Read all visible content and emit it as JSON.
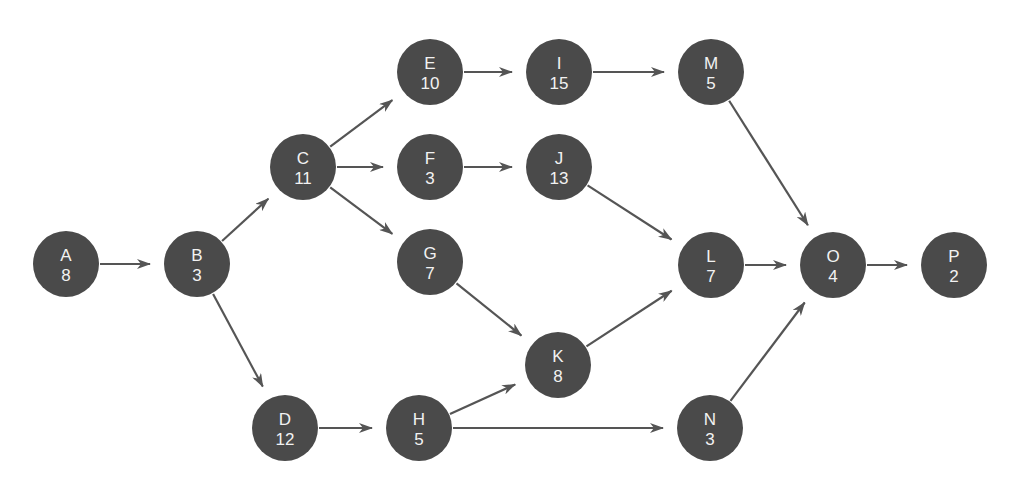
{
  "diagram": {
    "type": "activity-on-node network",
    "colors": {
      "node_fill": "#4a4a4a",
      "node_text": "#f2f2f2",
      "edge": "#555555",
      "background": "#ffffff"
    },
    "node_radius": 33,
    "nodes": [
      {
        "id": "A",
        "duration": "8",
        "x": 66,
        "y": 264
      },
      {
        "id": "B",
        "duration": "3",
        "x": 197,
        "y": 264
      },
      {
        "id": "C",
        "duration": "11",
        "x": 303,
        "y": 167
      },
      {
        "id": "D",
        "duration": "12",
        "x": 285,
        "y": 428
      },
      {
        "id": "E",
        "duration": "10",
        "x": 430,
        "y": 72
      },
      {
        "id": "F",
        "duration": "3",
        "x": 430,
        "y": 167
      },
      {
        "id": "G",
        "duration": "7",
        "x": 430,
        "y": 262
      },
      {
        "id": "H",
        "duration": "5",
        "x": 419,
        "y": 428
      },
      {
        "id": "I",
        "duration": "15",
        "x": 559,
        "y": 72
      },
      {
        "id": "J",
        "duration": "13",
        "x": 559,
        "y": 167
      },
      {
        "id": "K",
        "duration": "8",
        "x": 558,
        "y": 365
      },
      {
        "id": "L",
        "duration": "7",
        "x": 711,
        "y": 265
      },
      {
        "id": "M",
        "duration": "5",
        "x": 711,
        "y": 72
      },
      {
        "id": "N",
        "duration": "3",
        "x": 710,
        "y": 428
      },
      {
        "id": "O",
        "duration": "4",
        "x": 833,
        "y": 265
      },
      {
        "id": "P",
        "duration": "2",
        "x": 954,
        "y": 265
      }
    ],
    "edges": [
      [
        "A",
        "B"
      ],
      [
        "B",
        "C"
      ],
      [
        "B",
        "D"
      ],
      [
        "C",
        "E"
      ],
      [
        "C",
        "F"
      ],
      [
        "C",
        "G"
      ],
      [
        "D",
        "H"
      ],
      [
        "E",
        "I"
      ],
      [
        "F",
        "J"
      ],
      [
        "G",
        "K"
      ],
      [
        "H",
        "K"
      ],
      [
        "H",
        "N"
      ],
      [
        "I",
        "M"
      ],
      [
        "J",
        "L"
      ],
      [
        "K",
        "L"
      ],
      [
        "M",
        "O"
      ],
      [
        "L",
        "O"
      ],
      [
        "N",
        "O"
      ],
      [
        "O",
        "P"
      ]
    ]
  }
}
